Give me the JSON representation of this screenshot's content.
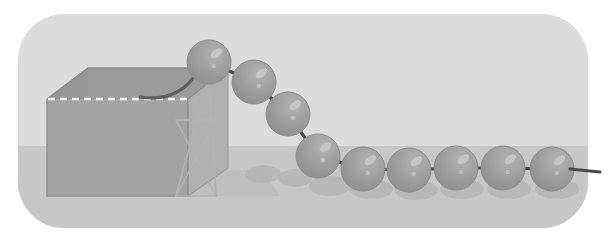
{
  "canvas": {
    "width": 612,
    "height": 244,
    "background_color": "#ffffff",
    "title": "newtons-cradle-illustration"
  },
  "stage": {
    "name": "rounded-stage-panel",
    "x": 18,
    "y": 14,
    "width": 570,
    "height": 214,
    "corner_radius": 46,
    "wall_color": "#dcdcdc",
    "floor_color": "#c7c7c7",
    "floor_top_y": 146
  },
  "box": {
    "name": "open-top-box",
    "front_face": {
      "x": 47,
      "y": 99,
      "width": 141,
      "height": 97,
      "color": "#a3a3a3"
    },
    "top_rim": {
      "color": "#9a9a9a"
    },
    "inner_left_wall": {
      "color": "#8a8a8a"
    },
    "inner_back_wall": {
      "color": "#999999"
    },
    "dashed_edge_color": "#f2f2f2",
    "outline_color": "#8e8e8e",
    "cord_inside_color": "#6d6d6d"
  },
  "stand": {
    "name": "wire-support-frame",
    "color": "#b5b5b5",
    "apex_x": 209,
    "apex_y": 76,
    "base_left_x": 176,
    "base_right_x": 215,
    "base_y": 196
  },
  "spheres": {
    "name": "ball-chain",
    "radius": 22,
    "fill_color": "#9d9d9d",
    "edge_color": "#8c8c8c",
    "highlight_color": "#c9c9c9",
    "connector_color": "#4a4a4a",
    "items": [
      {
        "label": "ball-1",
        "cx": 209,
        "cy": 62
      },
      {
        "label": "ball-2",
        "cx": 254,
        "cy": 82
      },
      {
        "label": "ball-3",
        "cx": 288,
        "cy": 114
      },
      {
        "label": "ball-4",
        "cx": 318,
        "cy": 156
      },
      {
        "label": "ball-5",
        "cx": 363,
        "cy": 169
      },
      {
        "label": "ball-6",
        "cx": 409,
        "cy": 170
      },
      {
        "label": "ball-7",
        "cx": 456,
        "cy": 168
      },
      {
        "label": "ball-8",
        "cx": 503,
        "cy": 168
      },
      {
        "label": "ball-9",
        "cx": 552,
        "cy": 169
      }
    ],
    "tail_end_x": 600
  },
  "shadows": {
    "name": "floor-shadows",
    "color": "#b3b3b3",
    "box_shadow_color": "#b9b9b9",
    "ellipses": [
      {
        "cx": 263,
        "cy": 174,
        "rx": 18,
        "ry": 9
      },
      {
        "cx": 295,
        "cy": 178,
        "rx": 17,
        "ry": 9
      },
      {
        "cx": 330,
        "cy": 186,
        "rx": 21,
        "ry": 10
      },
      {
        "cx": 371,
        "cy": 189,
        "rx": 22,
        "ry": 10
      },
      {
        "cx": 416,
        "cy": 190,
        "rx": 22,
        "ry": 10
      },
      {
        "cx": 462,
        "cy": 189,
        "rx": 22,
        "ry": 10
      },
      {
        "cx": 509,
        "cy": 189,
        "rx": 22,
        "ry": 10
      },
      {
        "cx": 557,
        "cy": 189,
        "rx": 22,
        "ry": 10
      }
    ]
  },
  "legend": {
    "scene_name": "Newton's cradle ball chain over open box",
    "elements": [
      "open-top-box",
      "wire-support-frame",
      "ball-chain",
      "floor-shadows",
      "rounded-stage-panel"
    ]
  }
}
